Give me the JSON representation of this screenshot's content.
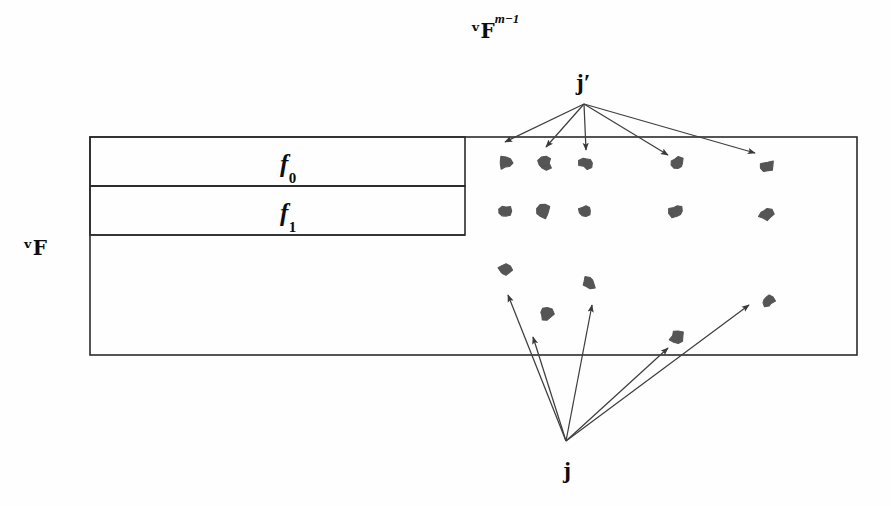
{
  "figure": {
    "type": "math-diagram",
    "background_color": "#fefefe",
    "ink_color": "#2b2b2b",
    "point_color": "#555555"
  },
  "labels": {
    "field_outer": "ᵛF",
    "field_power_base": "ᵛF",
    "field_power_exp": "m−1",
    "f0": "f",
    "f0_sub": "0",
    "f1": "f",
    "f1_sub": "1",
    "j_prime": "j",
    "j_prime_mark": "′",
    "j": "j"
  },
  "label_positions": {
    "field_outer": {
      "x": 35,
      "y": 248
    },
    "field_power": {
      "x": 495,
      "y": 30
    },
    "f0": {
      "x": 288,
      "y": 166
    },
    "f1": {
      "x": 288,
      "y": 215
    },
    "j_prime": {
      "x": 583,
      "y": 82
    },
    "j": {
      "x": 567,
      "y": 470
    }
  },
  "geometry": {
    "outer_box": {
      "x": 90,
      "y": 137,
      "width": 767,
      "height": 218
    },
    "inner_boxes": [
      {
        "name": "f0-strip",
        "x": 90,
        "y": 137,
        "width": 375,
        "height": 49
      },
      {
        "name": "f1-strip",
        "x": 90,
        "y": 186,
        "width": 375,
        "height": 49
      }
    ],
    "divider_lines": [
      {
        "x1": 90,
        "y1": 186,
        "x2": 465,
        "y2": 186
      },
      {
        "x1": 90,
        "y1": 235,
        "x2": 465,
        "y2": 235
      }
    ],
    "stroke_width": 1.6
  },
  "points": [
    {
      "x": 505,
      "y": 163
    },
    {
      "x": 545,
      "y": 163
    },
    {
      "x": 586,
      "y": 163
    },
    {
      "x": 677,
      "y": 163
    },
    {
      "x": 767,
      "y": 166
    },
    {
      "x": 505,
      "y": 211
    },
    {
      "x": 544,
      "y": 211
    },
    {
      "x": 585,
      "y": 211
    },
    {
      "x": 676,
      "y": 211
    },
    {
      "x": 766,
      "y": 214
    },
    {
      "x": 505,
      "y": 270
    },
    {
      "x": 589,
      "y": 283
    },
    {
      "x": 546,
      "y": 314
    },
    {
      "x": 768,
      "y": 301
    },
    {
      "x": 677,
      "y": 337
    }
  ],
  "arrows_from_j_prime": {
    "origin": {
      "x": 584,
      "y": 104
    },
    "targets": [
      {
        "x": 505,
        "y": 142
      },
      {
        "x": 546,
        "y": 147
      },
      {
        "x": 586,
        "y": 150
      },
      {
        "x": 668,
        "y": 155
      },
      {
        "x": 755,
        "y": 153
      }
    ]
  },
  "arrows_from_j": {
    "origin": {
      "x": 566,
      "y": 441
    },
    "targets": [
      {
        "x": 508,
        "y": 295
      },
      {
        "x": 533,
        "y": 337
      },
      {
        "x": 592,
        "y": 305
      },
      {
        "x": 668,
        "y": 348
      },
      {
        "x": 749,
        "y": 305
      }
    ]
  }
}
